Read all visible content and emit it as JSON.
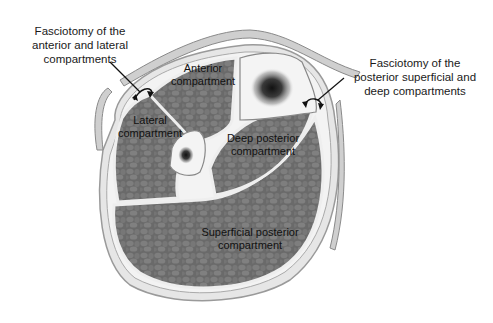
{
  "figure": {
    "callouts": {
      "left": {
        "line1": "Fasciotomy of the",
        "line2": "anterior and lateral",
        "line3": "compartments"
      },
      "right": {
        "line1": "Fasciotomy of the",
        "line2": "posterior superficial and",
        "line3": "deep compartments"
      }
    },
    "compartments": {
      "anterior": {
        "line1": "Anterior",
        "line2": "compartment"
      },
      "lateral": {
        "line1": "Lateral",
        "line2": "compartment"
      },
      "deep_posterior": {
        "line1": "Deep posterior",
        "line2": "compartment"
      },
      "superficial_posterior": {
        "line1": "Superficial posterior",
        "line2": "compartment"
      }
    },
    "colors": {
      "muscle": "#6b6b6b",
      "muscle_cell": "#7d7d7d",
      "fascia": "#f2f2f2",
      "skin": "#c8c8c8",
      "bone": "#f4f4f4",
      "marrow": "#222222",
      "text": "#1a1a1a"
    }
  }
}
